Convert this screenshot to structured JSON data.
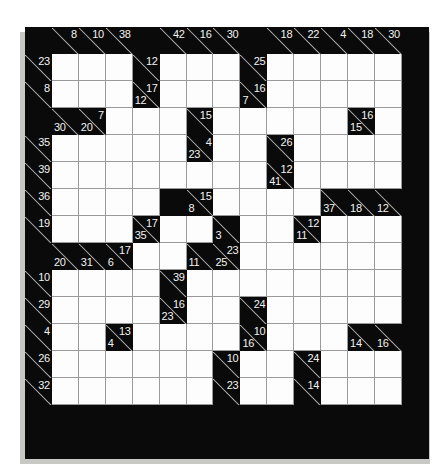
{
  "puzzle": {
    "name": "kakuro-grid",
    "type": "kakuro",
    "columns": 15,
    "rows": 16,
    "colors": {
      "block": "#0a0a0a",
      "open_cell": "#fdfdfd",
      "clue_text": "#f2f2f2",
      "grid_line": "#9a9a9a",
      "shadow": "#c8c8c4"
    },
    "grid": [
      [
        {
          "t": "block"
        },
        {
          "t": "clue",
          "right": "8"
        },
        {
          "t": "clue",
          "right": "10"
        },
        {
          "t": "clue",
          "right": "38"
        },
        {
          "t": "block"
        },
        {
          "t": "clue",
          "right": "42"
        },
        {
          "t": "clue",
          "right": "16"
        },
        {
          "t": "clue",
          "right": "30"
        },
        {
          "t": "block"
        },
        {
          "t": "clue",
          "right": "18"
        },
        {
          "t": "clue",
          "right": "22"
        },
        {
          "t": "clue",
          "right": "4"
        },
        {
          "t": "clue",
          "right": "18"
        },
        {
          "t": "clue",
          "right": "30"
        },
        {
          "t": "block"
        }
      ],
      [
        {
          "t": "clue",
          "right": "23"
        },
        {
          "t": "open"
        },
        {
          "t": "open"
        },
        {
          "t": "open"
        },
        {
          "t": "clue",
          "right": "12"
        },
        {
          "t": "open"
        },
        {
          "t": "open"
        },
        {
          "t": "open"
        },
        {
          "t": "clue",
          "right": "25"
        },
        {
          "t": "open"
        },
        {
          "t": "open"
        },
        {
          "t": "open"
        },
        {
          "t": "open"
        },
        {
          "t": "open"
        },
        {
          "t": "block"
        }
      ],
      [
        {
          "t": "clue",
          "right": "8"
        },
        {
          "t": "open"
        },
        {
          "t": "open"
        },
        {
          "t": "open"
        },
        {
          "t": "clue",
          "right": "17",
          "down": "12"
        },
        {
          "t": "open"
        },
        {
          "t": "open"
        },
        {
          "t": "open"
        },
        {
          "t": "clue",
          "right": "16",
          "down": "7"
        },
        {
          "t": "open"
        },
        {
          "t": "open"
        },
        {
          "t": "open"
        },
        {
          "t": "open"
        },
        {
          "t": "open"
        },
        {
          "t": "block"
        }
      ],
      [
        {
          "t": "block"
        },
        {
          "t": "clue",
          "down": "30"
        },
        {
          "t": "clue",
          "right": "7",
          "down": "20"
        },
        {
          "t": "open"
        },
        {
          "t": "open"
        },
        {
          "t": "open"
        },
        {
          "t": "clue",
          "right": "15"
        },
        {
          "t": "open"
        },
        {
          "t": "open"
        },
        {
          "t": "open"
        },
        {
          "t": "open"
        },
        {
          "t": "open"
        },
        {
          "t": "clue",
          "right": "16",
          "down": "15"
        },
        {
          "t": "open"
        },
        {
          "t": "block"
        }
      ],
      [
        {
          "t": "clue",
          "right": "35"
        },
        {
          "t": "open"
        },
        {
          "t": "open"
        },
        {
          "t": "open"
        },
        {
          "t": "open"
        },
        {
          "t": "open"
        },
        {
          "t": "clue",
          "right": "4",
          "down": "23"
        },
        {
          "t": "open"
        },
        {
          "t": "open"
        },
        {
          "t": "clue",
          "right": "26"
        },
        {
          "t": "open"
        },
        {
          "t": "open"
        },
        {
          "t": "open"
        },
        {
          "t": "open"
        },
        {
          "t": "block"
        }
      ],
      [
        {
          "t": "clue",
          "right": "39"
        },
        {
          "t": "open"
        },
        {
          "t": "open"
        },
        {
          "t": "open"
        },
        {
          "t": "open"
        },
        {
          "t": "open"
        },
        {
          "t": "open"
        },
        {
          "t": "open"
        },
        {
          "t": "open"
        },
        {
          "t": "clue",
          "right": "12",
          "down": "41"
        },
        {
          "t": "open"
        },
        {
          "t": "open"
        },
        {
          "t": "open"
        },
        {
          "t": "open"
        },
        {
          "t": "block"
        }
      ],
      [
        {
          "t": "clue",
          "right": "36"
        },
        {
          "t": "open"
        },
        {
          "t": "open"
        },
        {
          "t": "open"
        },
        {
          "t": "open"
        },
        {
          "t": "block"
        },
        {
          "t": "clue",
          "right": "15",
          "down": "8"
        },
        {
          "t": "open"
        },
        {
          "t": "open"
        },
        {
          "t": "open"
        },
        {
          "t": "open"
        },
        {
          "t": "clue",
          "down": "37"
        },
        {
          "t": "clue",
          "down": "18"
        },
        {
          "t": "clue",
          "down": "12"
        },
        {
          "t": "block"
        }
      ],
      [
        {
          "t": "clue",
          "right": "19"
        },
        {
          "t": "open"
        },
        {
          "t": "open"
        },
        {
          "t": "open"
        },
        {
          "t": "clue",
          "right": "17",
          "down": "35"
        },
        {
          "t": "open"
        },
        {
          "t": "open"
        },
        {
          "t": "clue",
          "down": "3"
        },
        {
          "t": "open"
        },
        {
          "t": "open"
        },
        {
          "t": "clue",
          "right": "12",
          "down": "11"
        },
        {
          "t": "open"
        },
        {
          "t": "open"
        },
        {
          "t": "open"
        },
        {
          "t": "block"
        }
      ],
      [
        {
          "t": "block"
        },
        {
          "t": "clue",
          "down": "20"
        },
        {
          "t": "clue",
          "down": "31"
        },
        {
          "t": "clue",
          "right": "17",
          "down": "6"
        },
        {
          "t": "open"
        },
        {
          "t": "open"
        },
        {
          "t": "clue",
          "down": "11"
        },
        {
          "t": "clue",
          "right": "23",
          "down": "25"
        },
        {
          "t": "open"
        },
        {
          "t": "open"
        },
        {
          "t": "open"
        },
        {
          "t": "open"
        },
        {
          "t": "open"
        },
        {
          "t": "open"
        },
        {
          "t": "block"
        }
      ],
      [
        {
          "t": "clue",
          "right": "10"
        },
        {
          "t": "open"
        },
        {
          "t": "open"
        },
        {
          "t": "open"
        },
        {
          "t": "open"
        },
        {
          "t": "clue",
          "right": "39"
        },
        {
          "t": "open"
        },
        {
          "t": "open"
        },
        {
          "t": "open"
        },
        {
          "t": "open"
        },
        {
          "t": "open"
        },
        {
          "t": "open"
        },
        {
          "t": "open"
        },
        {
          "t": "open"
        },
        {
          "t": "block"
        }
      ],
      [
        {
          "t": "clue",
          "right": "29"
        },
        {
          "t": "open"
        },
        {
          "t": "open"
        },
        {
          "t": "open"
        },
        {
          "t": "open"
        },
        {
          "t": "clue",
          "right": "16",
          "down": "23"
        },
        {
          "t": "open"
        },
        {
          "t": "open"
        },
        {
          "t": "clue",
          "right": "24"
        },
        {
          "t": "open"
        },
        {
          "t": "open"
        },
        {
          "t": "open"
        },
        {
          "t": "open"
        },
        {
          "t": "open"
        },
        {
          "t": "block"
        }
      ],
      [
        {
          "t": "clue",
          "right": "4"
        },
        {
          "t": "open"
        },
        {
          "t": "open"
        },
        {
          "t": "clue",
          "right": "13",
          "down": "4"
        },
        {
          "t": "open"
        },
        {
          "t": "open"
        },
        {
          "t": "open"
        },
        {
          "t": "open"
        },
        {
          "t": "clue",
          "right": "10",
          "down": "16"
        },
        {
          "t": "open"
        },
        {
          "t": "open"
        },
        {
          "t": "open"
        },
        {
          "t": "clue",
          "down": "14"
        },
        {
          "t": "clue",
          "down": "16"
        },
        {
          "t": "block"
        }
      ],
      [
        {
          "t": "clue",
          "right": "26"
        },
        {
          "t": "open"
        },
        {
          "t": "open"
        },
        {
          "t": "open"
        },
        {
          "t": "open"
        },
        {
          "t": "open"
        },
        {
          "t": "open"
        },
        {
          "t": "clue",
          "right": "10"
        },
        {
          "t": "open"
        },
        {
          "t": "open"
        },
        {
          "t": "clue",
          "right": "24"
        },
        {
          "t": "open"
        },
        {
          "t": "open"
        },
        {
          "t": "open"
        },
        {
          "t": "block"
        }
      ],
      [
        {
          "t": "clue",
          "right": "32"
        },
        {
          "t": "open"
        },
        {
          "t": "open"
        },
        {
          "t": "open"
        },
        {
          "t": "open"
        },
        {
          "t": "open"
        },
        {
          "t": "open"
        },
        {
          "t": "clue",
          "right": "23"
        },
        {
          "t": "open"
        },
        {
          "t": "open"
        },
        {
          "t": "clue",
          "right": "14"
        },
        {
          "t": "open"
        },
        {
          "t": "open"
        },
        {
          "t": "open"
        },
        {
          "t": "block"
        }
      ],
      [
        {
          "t": "block"
        },
        {
          "t": "block"
        },
        {
          "t": "block"
        },
        {
          "t": "block"
        },
        {
          "t": "block"
        },
        {
          "t": "block"
        },
        {
          "t": "block"
        },
        {
          "t": "block"
        },
        {
          "t": "block"
        },
        {
          "t": "block"
        },
        {
          "t": "block"
        },
        {
          "t": "block"
        },
        {
          "t": "block"
        },
        {
          "t": "block"
        },
        {
          "t": "block"
        }
      ],
      [
        {
          "t": "block"
        },
        {
          "t": "block"
        },
        {
          "t": "block"
        },
        {
          "t": "block"
        },
        {
          "t": "block"
        },
        {
          "t": "block"
        },
        {
          "t": "block"
        },
        {
          "t": "block"
        },
        {
          "t": "block"
        },
        {
          "t": "block"
        },
        {
          "t": "block"
        },
        {
          "t": "block"
        },
        {
          "t": "block"
        },
        {
          "t": "block"
        },
        {
          "t": "block"
        }
      ]
    ]
  }
}
